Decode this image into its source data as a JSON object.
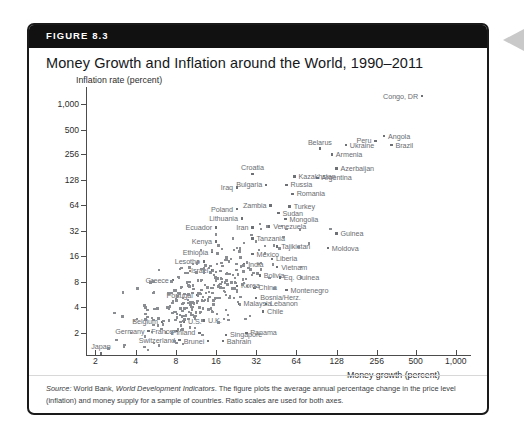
{
  "figure": {
    "banner_label": "FIGURE 8.3",
    "title": "Money Growth and Inflation around the World, 1990–2011",
    "source_prefix": "Source:",
    "source_body_1": " World Bank, ",
    "source_italic": "World Development Indicators",
    "source_body_2": ". The figure plots the average annual percentage change in the price level (inflation) and money supply for a sample of countries. Ratio scales are used for both axes."
  },
  "chart_data": {
    "type": "scatter",
    "title": "Money Growth and Inflation around the World, 1990–2011",
    "xlabel": "Money growth (percent)",
    "ylabel": "Inflation rate (percent)",
    "xscale": "log",
    "yscale": "log",
    "grid": false,
    "legend": "none",
    "xticks": [
      "2",
      "4",
      "8",
      "16",
      "32",
      "64",
      "128",
      "256",
      "500",
      "1,000"
    ],
    "xtick_values": [
      2,
      4,
      8,
      16,
      32,
      64,
      128,
      256,
      500,
      1000
    ],
    "yticks": [
      "1,000",
      "500",
      "256",
      "128",
      "64",
      "32",
      "16",
      "8",
      "4",
      "2"
    ],
    "ytick_values": [
      1000,
      500,
      256,
      128,
      64,
      32,
      16,
      8,
      4,
      2
    ],
    "xlim": [
      1.7,
      1300
    ],
    "ylim": [
      1.1,
      1600
    ],
    "points": [
      {
        "label": "Congo, DR",
        "x": 560,
        "y": 1250,
        "label_pos": "left"
      },
      {
        "label": "Angola",
        "x": 290,
        "y": 420,
        "label_pos": "right"
      },
      {
        "label": "Brazil",
        "x": 330,
        "y": 330,
        "label_pos": "right"
      },
      {
        "label": "Peru",
        "x": 250,
        "y": 370,
        "label_pos": "left"
      },
      {
        "label": "Ukraine",
        "x": 150,
        "y": 330,
        "label_pos": "right"
      },
      {
        "label": "Belarus",
        "x": 96,
        "y": 300,
        "label_pos": "above"
      },
      {
        "label": "Armenia",
        "x": 118,
        "y": 255,
        "label_pos": "right"
      },
      {
        "label": "Azerbaijan",
        "x": 128,
        "y": 175,
        "label_pos": "right"
      },
      {
        "label": "Argentina",
        "x": 92,
        "y": 135,
        "label_pos": "right"
      },
      {
        "label": "Kazakhstan",
        "x": 62,
        "y": 140,
        "label_pos": "right"
      },
      {
        "label": "Croatia",
        "x": 30,
        "y": 150,
        "label_pos": "above"
      },
      {
        "label": "Russia",
        "x": 54,
        "y": 112,
        "label_pos": "right"
      },
      {
        "label": "Bulgaria",
        "x": 38,
        "y": 112,
        "label_pos": "left"
      },
      {
        "label": "Iraq",
        "x": 23,
        "y": 104,
        "label_pos": "left"
      },
      {
        "label": "Romania",
        "x": 60,
        "y": 88,
        "label_pos": "right"
      },
      {
        "label": "Turkey",
        "x": 57,
        "y": 62,
        "label_pos": "right"
      },
      {
        "label": "Zambia",
        "x": 41,
        "y": 64,
        "label_pos": "left"
      },
      {
        "label": "Sudan",
        "x": 47,
        "y": 52,
        "label_pos": "right"
      },
      {
        "label": "Poland",
        "x": 23,
        "y": 58,
        "label_pos": "left"
      },
      {
        "label": "Lithuania",
        "x": 25,
        "y": 45,
        "label_pos": "left"
      },
      {
        "label": "Mongolia",
        "x": 53,
        "y": 44,
        "label_pos": "right"
      },
      {
        "label": "Venezuela",
        "x": 40,
        "y": 36,
        "label_pos": "right"
      },
      {
        "label": "Iran",
        "x": 30,
        "y": 35,
        "label_pos": "left"
      },
      {
        "label": "Ecuador",
        "x": 16,
        "y": 35,
        "label_pos": "left"
      },
      {
        "label": "Guinea",
        "x": 128,
        "y": 30,
        "label_pos": "right"
      },
      {
        "label": "Tanzania",
        "x": 30,
        "y": 26,
        "label_pos": "right"
      },
      {
        "label": "Kenya",
        "x": 16,
        "y": 24,
        "label_pos": "left"
      },
      {
        "label": "Moldova",
        "x": 110,
        "y": 20,
        "label_pos": "right"
      },
      {
        "label": "Tajikistan",
        "x": 46,
        "y": 21,
        "label_pos": "right"
      },
      {
        "label": "Ethiopia",
        "x": 15,
        "y": 18,
        "label_pos": "left"
      },
      {
        "label": "Mexico",
        "x": 30,
        "y": 17,
        "label_pos": "right"
      },
      {
        "label": "Liberia",
        "x": 42,
        "y": 15,
        "label_pos": "right"
      },
      {
        "label": "Lesotho",
        "x": 13,
        "y": 14,
        "label_pos": "left"
      },
      {
        "label": "India",
        "x": 26,
        "y": 13,
        "label_pos": "right"
      },
      {
        "label": "Vietnam",
        "x": 46,
        "y": 12,
        "label_pos": "right"
      },
      {
        "label": "Israel",
        "x": 15,
        "y": 11,
        "label_pos": "left"
      },
      {
        "label": "Bolivia",
        "x": 34,
        "y": 9.5,
        "label_pos": "right"
      },
      {
        "label": "Eq. Guinea",
        "x": 48,
        "y": 9,
        "label_pos": "right"
      },
      {
        "label": "Korea",
        "x": 23,
        "y": 7.2,
        "label_pos": "right"
      },
      {
        "label": "China",
        "x": 31,
        "y": 6.8,
        "label_pos": "right"
      },
      {
        "label": "Montenegro",
        "x": 54,
        "y": 6.4,
        "label_pos": "right"
      },
      {
        "label": "Greece",
        "x": 7.6,
        "y": 8.4,
        "label_pos": "left"
      },
      {
        "label": "Portugal",
        "x": 11.5,
        "y": 5.6,
        "label_pos": "left"
      },
      {
        "label": "Bosnia/Herz.",
        "x": 32,
        "y": 5.2,
        "label_pos": "right"
      },
      {
        "label": "Malaysia",
        "x": 24,
        "y": 4.4,
        "label_pos": "right"
      },
      {
        "label": "Lebanon",
        "x": 38,
        "y": 4.4,
        "label_pos": "right"
      },
      {
        "label": "Chile",
        "x": 36,
        "y": 3.6,
        "label_pos": "right"
      },
      {
        "label": "Belgium",
        "x": 6.3,
        "y": 2.7,
        "label_pos": "left"
      },
      {
        "label": "U.S.",
        "x": 9.2,
        "y": 2.7,
        "label_pos": "right"
      },
      {
        "label": "U.K.",
        "x": 13,
        "y": 2.8,
        "label_pos": "right"
      },
      {
        "label": "France",
        "x": 8.2,
        "y": 2.1,
        "label_pos": "left"
      },
      {
        "label": "Germany",
        "x": 5.0,
        "y": 2.1,
        "label_pos": "left"
      },
      {
        "label": "Finland",
        "x": 12,
        "y": 2.0,
        "label_pos": "left"
      },
      {
        "label": "Singapore",
        "x": 19,
        "y": 1.9,
        "label_pos": "right"
      },
      {
        "label": "Panama",
        "x": 27,
        "y": 2.0,
        "label_pos": "right"
      },
      {
        "label": "Switzerland",
        "x": 8.5,
        "y": 1.65,
        "label_pos": "left"
      },
      {
        "label": "Brunei",
        "x": 14,
        "y": 1.6,
        "label_pos": "left"
      },
      {
        "label": "Bahrain",
        "x": 18,
        "y": 1.6,
        "label_pos": "right"
      },
      {
        "label": "Japan",
        "x": 2.2,
        "y": 1.15,
        "label_pos": "above"
      }
    ],
    "unlabeled_cloud_note": "Dense cloud of additional country observations clustered between money growth 6–40 percent and inflation 2–20 percent"
  }
}
